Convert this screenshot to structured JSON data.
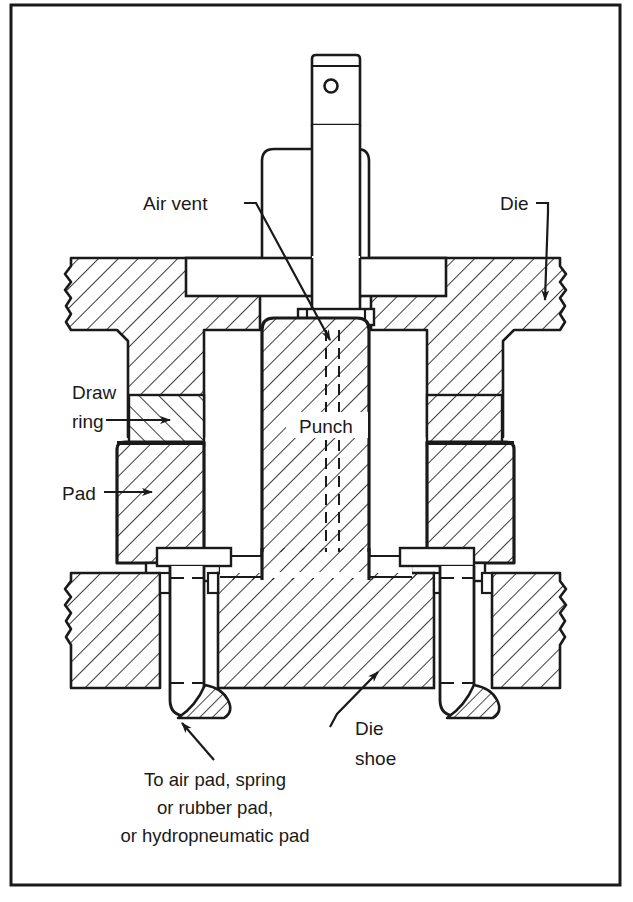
{
  "figure": {
    "background_color": "#ffffff",
    "line_color": "#1a1a1a",
    "frame": {
      "stroke_width": 3,
      "x": 11,
      "y": 5,
      "width": 609,
      "height": 880
    }
  },
  "labels": {
    "air_vent": "Air vent",
    "die": "Die",
    "draw_ring_line1": "Draw",
    "draw_ring_line2": "ring",
    "pad": "Pad",
    "punch": "Punch",
    "die_shoe_line1": "Die",
    "die_shoe_line2": "shoe",
    "bottom_note_line1": "To air pad, spring",
    "bottom_note_line2": "or rubber pad,",
    "bottom_note_line3": "or hydropneumatic pad"
  },
  "components": [
    {
      "name": "punch-shank",
      "label": ""
    },
    {
      "name": "punch-shank-hole",
      "label": ""
    },
    {
      "name": "punch-holder-plate",
      "label": ""
    },
    {
      "name": "upper-die-block-left",
      "label": "Die"
    },
    {
      "name": "upper-die-block-right",
      "label": "Die"
    },
    {
      "name": "punch-body",
      "label": "Punch"
    },
    {
      "name": "draw-ring-left",
      "label": "Draw ring"
    },
    {
      "name": "draw-ring-right",
      "label": "Draw ring"
    },
    {
      "name": "pad-left",
      "label": "Pad"
    },
    {
      "name": "pad-right",
      "label": "Pad"
    },
    {
      "name": "die-shoe",
      "label": "Die shoe"
    },
    {
      "name": "pressure-pin-left",
      "label": ""
    },
    {
      "name": "pressure-pin-right",
      "label": ""
    }
  ],
  "hatching": {
    "style": "45-degree-section-lines",
    "spacing_px": 14,
    "stroke_width": 1.6
  },
  "leaders": [
    {
      "name": "air-vent-leader",
      "from_label": "Air vent",
      "to_component": "punch-body-vent"
    },
    {
      "name": "die-leader",
      "from_label": "Die",
      "to_component": "upper-die-block-right"
    },
    {
      "name": "draw-ring-leader",
      "from_label": "Draw ring",
      "to_component": "draw-ring-left"
    },
    {
      "name": "pad-leader",
      "from_label": "Pad",
      "to_component": "pad-left"
    },
    {
      "name": "die-shoe-leader",
      "from_label": "Die shoe",
      "to_component": "die-shoe"
    },
    {
      "name": "bottom-note-leader",
      "from_label": "To air pad, spring or rubber pad, or hydropneumatic pad",
      "to_component": "pressure-pin-left"
    }
  ]
}
